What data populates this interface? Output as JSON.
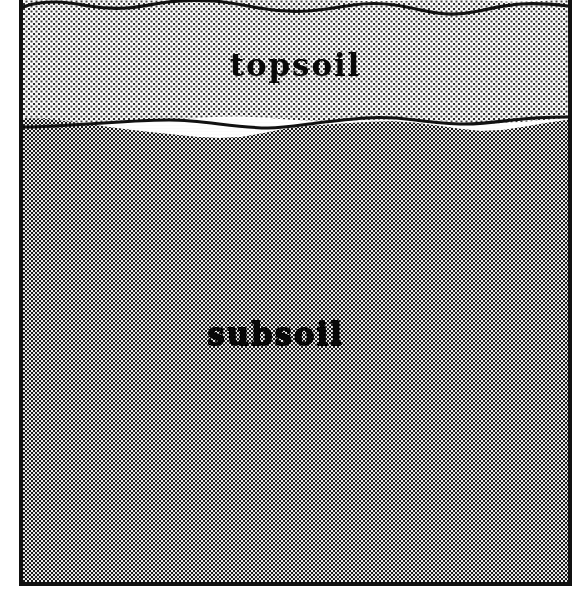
{
  "figure": {
    "kind": "soil-profile-cross-section",
    "caption": "",
    "frame": {
      "border_color": "#111111",
      "border_width_px": 4,
      "background": "#ffffff"
    }
  },
  "layers": [
    {
      "id": "topsoil",
      "label": "topsoil",
      "fill_style": "light stipple",
      "fill_color": "#fdfdfd",
      "dot_color": "#2b2b2b",
      "top_boundary": "wavy ground surface",
      "bottom_boundary": "wavy soil horizon",
      "label_color": "#080808"
    },
    {
      "id": "subsoil",
      "label": "subsoil",
      "fill_style": "dense checkerboard halftone",
      "fill_color": "#b4b4b4",
      "dot_color": "#1a1a1a",
      "top_boundary": "wavy soil horizon",
      "bottom_boundary": "frame base",
      "label_color": "#080808"
    }
  ],
  "boundaries": {
    "ground_surface_line_color": "#111111",
    "soil_horizon_line_color": "#111111"
  }
}
